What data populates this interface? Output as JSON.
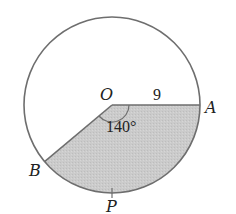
{
  "diagram": {
    "type": "circle-sector",
    "labels": {
      "center": "O",
      "point_a": "A",
      "point_b": "B",
      "point_p": "P",
      "radius": "9",
      "angle": "140°"
    },
    "geometry": {
      "radius_value": 9,
      "central_angle_deg": 140,
      "shaded_region": "sector AOB containing P"
    },
    "colors": {
      "stroke": "#6e6e6e",
      "shade": "#c9c9c9",
      "background": "#ffffff"
    }
  }
}
